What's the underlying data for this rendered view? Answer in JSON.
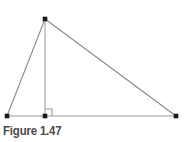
{
  "figure": {
    "caption": "Figure 1.47",
    "caption_color": "#4a4a4a",
    "background_color": "#ffffff"
  },
  "chart_data": {
    "type": "diagram",
    "title": "Figure 1.47",
    "canvas": {
      "width": 184,
      "height": 142
    },
    "colors": {
      "side_stroke": "#8a8a8a",
      "altitude_stroke": "#b0b0b0",
      "base_stroke": "#9a9a9a",
      "right_angle_stroke": "#9a9a9a",
      "vertex_fill": "#1a1a1a"
    },
    "points": [
      {
        "name": "apex",
        "label": "",
        "x": 45,
        "y": 19
      },
      {
        "name": "base-left",
        "label": "",
        "x": 7,
        "y": 116
      },
      {
        "name": "altitude-foot",
        "label": "",
        "x": 45,
        "y": 116
      },
      {
        "name": "base-right",
        "label": "",
        "x": 176,
        "y": 116
      }
    ],
    "segments": [
      {
        "name": "left-side",
        "from": "apex",
        "to": "base-left",
        "x1": 45,
        "y1": 19,
        "x2": 7,
        "y2": 116,
        "stroke": "#8a8a8a",
        "width": 1.1
      },
      {
        "name": "hypotenuse",
        "from": "apex",
        "to": "base-right",
        "x1": 45,
        "y1": 19,
        "x2": 176,
        "y2": 116,
        "stroke": "#8a8a8a",
        "width": 1.1
      },
      {
        "name": "base",
        "from": "base-left",
        "to": "base-right",
        "x1": 7,
        "y1": 116,
        "x2": 176,
        "y2": 116,
        "stroke": "#9a9a9a",
        "width": 1.1
      },
      {
        "name": "altitude",
        "from": "apex",
        "to": "altitude-foot",
        "x1": 45,
        "y1": 19,
        "x2": 45,
        "y2": 116,
        "stroke": "#b0b0b0",
        "width": 1.3
      }
    ],
    "markers": [
      {
        "name": "right-angle",
        "at": "altitude-foot",
        "size": 7,
        "path": "M 45 109 L 52 109 L 52 116",
        "stroke": "#9a9a9a",
        "width": 1.1
      }
    ],
    "vertex_dot_size": 4.6
  }
}
